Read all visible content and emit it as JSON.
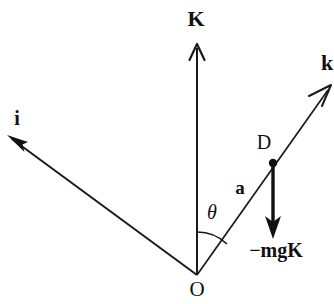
{
  "figure": {
    "background_color": "#ffffff",
    "ink_color": "#111111",
    "width": 334,
    "height": 304
  },
  "labels": {
    "k_upper": "K",
    "i_lower": "i",
    "k_lower": "k",
    "origin": "O",
    "point_d": "D",
    "vector_a": "a",
    "theta": "θ",
    "force": "−mgK"
  },
  "points": {
    "origin": {
      "x": 197,
      "y": 275
    },
    "d": {
      "x": 273,
      "y": 163
    }
  },
  "vectors": [
    {
      "name": "K",
      "label": "K",
      "from": "origin",
      "to_x": 197,
      "to_y": 45,
      "style": "thin-arrow"
    },
    {
      "name": "i",
      "label": "i",
      "from": "origin",
      "to_x": 8,
      "to_y": 137,
      "style": "thin-arrow"
    },
    {
      "name": "k",
      "label": "k",
      "from": "origin",
      "to_x": 331,
      "to_y": 86,
      "style": "thin-arrow"
    },
    {
      "name": "minus-mgK",
      "label": "−mgK",
      "from": "d",
      "to_x": 273,
      "to_y": 238,
      "style": "thick-arrow"
    }
  ],
  "angle": {
    "symbol": "θ",
    "between": [
      "K",
      "a"
    ],
    "vertex": "origin",
    "arc_radius": 43
  },
  "label_positions": {
    "k_upper": {
      "x": 196,
      "y": 20
    },
    "i_lower": {
      "x": 17,
      "y": 119
    },
    "k_lower": {
      "x": 327,
      "y": 64
    },
    "origin": {
      "x": 197,
      "y": 291
    },
    "point_d": {
      "x": 264,
      "y": 143
    },
    "vector_a": {
      "x": 240,
      "y": 189
    },
    "theta": {
      "x": 212,
      "y": 214
    },
    "force": {
      "x": 276,
      "y": 251
    }
  }
}
